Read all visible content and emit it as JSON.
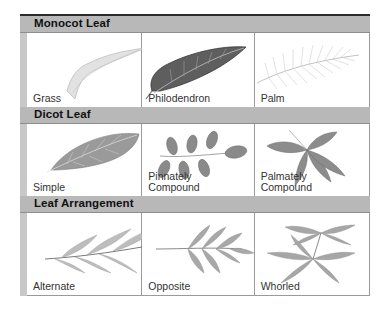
{
  "sections": [
    {
      "title": "Monocot Leaf",
      "items": [
        {
          "label": "Grass",
          "illustration": "grass-leaf-icon"
        },
        {
          "label": "Philodendron",
          "illustration": "philodendron-leaf-icon"
        },
        {
          "label": "Palm",
          "illustration": "palm-leaf-icon"
        }
      ]
    },
    {
      "title": "Dicot Leaf",
      "items": [
        {
          "label": "Simple",
          "illustration": "simple-leaf-icon"
        },
        {
          "label": "Pinnately\nCompound",
          "line1": "Pinnately",
          "line2": "Compound",
          "illustration": "pinnate-compound-leaf-icon"
        },
        {
          "label": "Palmately\nCompound",
          "line1": "Palmately",
          "line2": "Compound",
          "illustration": "palmate-compound-leaf-icon"
        }
      ]
    },
    {
      "title": "Leaf Arrangement",
      "items": [
        {
          "label": "Alternate",
          "illustration": "alternate-arrangement-icon"
        },
        {
          "label": "Opposite",
          "illustration": "opposite-arrangement-icon"
        },
        {
          "label": "Whorled",
          "illustration": "whorled-arrangement-icon"
        }
      ]
    }
  ],
  "colors": {
    "header_bg": "#b8b8b8",
    "leaf_dark": "#5a5a5a",
    "leaf_mid": "#8a8a8a",
    "leaf_light": "#c4c4c4"
  }
}
